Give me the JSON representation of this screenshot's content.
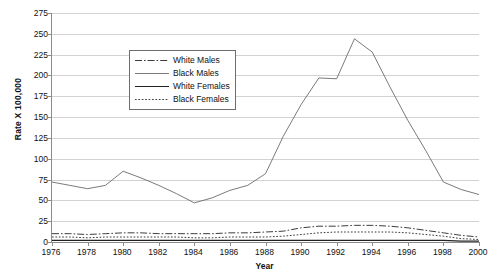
{
  "chart_data": {
    "type": "line",
    "title": "",
    "xlabel": "Year",
    "ylabel": "Rate X 100,000",
    "xlim": [
      1976,
      2000
    ],
    "ylim": [
      0,
      275
    ],
    "ytick_step": 25,
    "xtick_step": 2,
    "grid": "horizontal",
    "legend_position": "upper-left-inside",
    "x": [
      1976,
      1977,
      1978,
      1979,
      1980,
      1981,
      1982,
      1983,
      1984,
      1985,
      1986,
      1987,
      1988,
      1989,
      1990,
      1991,
      1992,
      1993,
      1994,
      1995,
      1996,
      1997,
      1998,
      1999,
      2000
    ],
    "ytick_labels": [
      "275",
      "250",
      "225",
      "200",
      "175",
      "150",
      "125",
      "100",
      "75",
      "50",
      "25",
      "0"
    ],
    "ytick_values": [
      275,
      250,
      225,
      200,
      175,
      150,
      125,
      100,
      75,
      50,
      25,
      0
    ],
    "xtick_labels": [
      "1976",
      "1978",
      "1980",
      "1982",
      "1984",
      "1986",
      "1988",
      "1990",
      "1992",
      "1994",
      "1996",
      "1998",
      "2000"
    ],
    "xtick_values": [
      1976,
      1978,
      1980,
      1982,
      1984,
      1986,
      1988,
      1990,
      1992,
      1994,
      1996,
      1998,
      2000
    ],
    "series": [
      {
        "name": "White Males",
        "style": "dash-dot",
        "color": "#3d3d3d",
        "values": [
          10,
          10,
          9,
          10,
          11,
          11,
          10,
          10,
          10,
          10,
          11,
          11,
          12,
          13,
          17,
          19,
          19,
          20,
          20,
          19,
          17,
          14,
          11,
          8,
          6
        ]
      },
      {
        "name": "Black Males",
        "style": "solid-light",
        "color": "#6b6b6b",
        "values": [
          72,
          68,
          64,
          68,
          85,
          77,
          68,
          58,
          47,
          53,
          62,
          68,
          82,
          127,
          165,
          197,
          196,
          244,
          228,
          186,
          146,
          110,
          72,
          63,
          57
        ]
      },
      {
        "name": "White Females",
        "style": "solid-dark",
        "color": "#222222",
        "values": [
          2,
          2,
          2,
          2,
          2,
          2,
          2,
          2,
          2,
          2,
          2,
          2,
          2,
          2,
          2,
          2,
          2,
          2,
          2,
          2,
          2,
          2,
          2,
          1,
          1
        ]
      },
      {
        "name": "Black Females",
        "style": "dotted",
        "color": "#3d3d3d",
        "values": [
          6,
          6,
          5,
          6,
          6,
          6,
          6,
          6,
          5,
          5,
          6,
          6,
          6,
          7,
          9,
          11,
          12,
          12,
          12,
          12,
          11,
          9,
          7,
          4,
          3
        ]
      }
    ]
  }
}
